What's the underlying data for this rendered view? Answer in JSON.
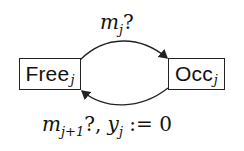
{
  "diagram": {
    "type": "state-machine",
    "states": [
      {
        "id": "free",
        "name": "Free",
        "subscript": "j"
      },
      {
        "id": "occ",
        "name": "Occ",
        "subscript": "j"
      }
    ],
    "transitions": [
      {
        "from": "free",
        "to": "occ",
        "label": {
          "var": "m",
          "sub": "j",
          "suffix": "?"
        }
      },
      {
        "from": "occ",
        "to": "free",
        "label": {
          "var": "m",
          "sub": "j+1",
          "suffix": "?, ",
          "var2": "y",
          "sub2": "j",
          "suffix2": " := 0"
        }
      }
    ]
  }
}
